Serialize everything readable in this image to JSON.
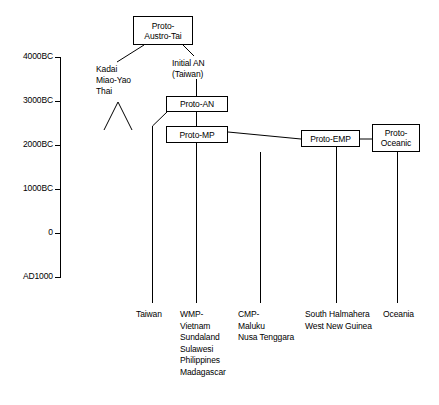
{
  "figure": {
    "type": "diagram",
    "subtype": "linguistic-phylogeny-timeline",
    "background_color": "#ffffff",
    "line_color": "#000000"
  },
  "axis": {
    "name": "time-axis",
    "orientation": "vertical",
    "ticks": [
      {
        "label": "4000BC",
        "y": 57
      },
      {
        "label": "3000BC",
        "y": 101
      },
      {
        "label": "2000BC",
        "y": 145
      },
      {
        "label": "1000BC",
        "y": 189
      },
      {
        "label": "0",
        "y": 233
      },
      {
        "label": "AD1000",
        "y": 277
      }
    ]
  },
  "nodes": [
    {
      "id": "proto-austro-tai",
      "label": "Proto-\nAustro-Tai",
      "boxed": true,
      "x": 133,
      "y": 16,
      "w": 60,
      "h": 29
    },
    {
      "id": "proto-an",
      "label": "Proto-AN",
      "boxed": true,
      "x": 166,
      "y": 96,
      "w": 62,
      "h": 16
    },
    {
      "id": "proto-mp",
      "label": "Proto-MP",
      "boxed": true,
      "x": 166,
      "y": 126,
      "w": 62,
      "h": 17
    },
    {
      "id": "proto-emp",
      "label": "Proto-EMP",
      "boxed": true,
      "x": 301,
      "y": 130,
      "w": 59,
      "h": 17
    },
    {
      "id": "proto-oceanic",
      "label": "Proto-\nOceanic",
      "boxed": true,
      "x": 372,
      "y": 124,
      "w": 48,
      "h": 28
    }
  ],
  "annotations": [
    {
      "id": "kadai-miao-yao-thai",
      "label": "Kadai\nMiao-Yao\nThai",
      "x": 96,
      "y": 64
    },
    {
      "id": "initial-an-taiwan",
      "label": "Initial AN\n(Taiwan)",
      "x": 172,
      "y": 58
    }
  ],
  "leaves": [
    {
      "id": "taiwan",
      "label": "Taiwan",
      "x": 136,
      "y": 309
    },
    {
      "id": "wmp",
      "label": "WMP-\nVietnam\nSundaland\nSulawesi\nPhilippines\nMadagascar",
      "x": 180,
      "y": 309
    },
    {
      "id": "cmp",
      "label": "CMP-\nMaluku\nNusa Tenggara",
      "x": 238,
      "y": 309
    },
    {
      "id": "south-halmahera",
      "label": "South Halmahera\nWest New Guinea",
      "x": 305,
      "y": 309
    },
    {
      "id": "oceania",
      "label": "Oceania",
      "x": 383,
      "y": 309
    }
  ],
  "edges": [
    {
      "id": "edge-pat-to-kadai",
      "from": "proto-austro-tai",
      "to": "kadai-miao-yao-thai"
    },
    {
      "id": "edge-pat-to-initial-an",
      "from": "proto-austro-tai",
      "to": "initial-an-taiwan"
    },
    {
      "id": "edge-initial-an-to-proto-an",
      "from": "initial-an-taiwan",
      "to": "proto-an"
    },
    {
      "id": "edge-proto-an-to-proto-mp",
      "from": "proto-an",
      "to": "proto-mp"
    },
    {
      "id": "edge-proto-an-to-taiwan",
      "from": "proto-an",
      "to": "taiwan"
    },
    {
      "id": "edge-proto-mp-to-wmp",
      "from": "proto-mp",
      "to": "wmp"
    },
    {
      "id": "edge-proto-mp-to-cmp",
      "from": "proto-mp",
      "to": "cmp"
    },
    {
      "id": "edge-proto-mp-to-proto-emp",
      "from": "proto-mp",
      "to": "proto-emp"
    },
    {
      "id": "edge-proto-emp-to-south-halmahera",
      "from": "proto-emp",
      "to": "south-halmahera"
    },
    {
      "id": "edge-proto-emp-to-proto-oceanic",
      "from": "proto-emp",
      "to": "proto-oceanic"
    },
    {
      "id": "edge-proto-oceanic-to-oceania",
      "from": "proto-oceanic",
      "to": "oceania"
    },
    {
      "id": "edge-kadai-fork-left",
      "from": "kadai-miao-yao-thai",
      "to": "fork-left"
    },
    {
      "id": "edge-kadai-fork-right",
      "from": "kadai-miao-yao-thai",
      "to": "fork-right"
    }
  ]
}
